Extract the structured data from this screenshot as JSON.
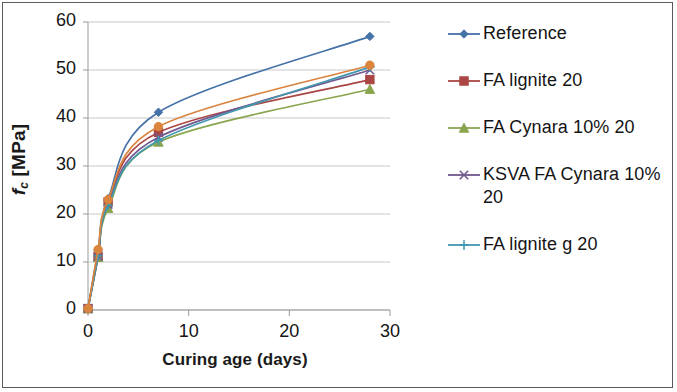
{
  "chart_data": {
    "type": "line",
    "title": "",
    "xlabel": "Curing age (days)",
    "ylabel": "fc [MPa]",
    "ylabel_parts": {
      "italic": "f",
      "subscript": "c",
      "rest": " [MPa]"
    },
    "x": [
      0,
      1,
      2,
      7,
      28
    ],
    "xlim": [
      0,
      30
    ],
    "ylim": [
      0,
      60
    ],
    "xticks": [
      0,
      10,
      20,
      30
    ],
    "yticks": [
      0,
      10,
      20,
      30,
      40,
      50,
      60
    ],
    "grid": "horizontal",
    "legend_position": "right",
    "series": [
      {
        "name": "Reference",
        "color": "#4572a7",
        "marker": "diamond",
        "values": [
          0.3,
          12.4,
          23.2,
          41.2,
          57.0
        ]
      },
      {
        "name": "FA lignite 20",
        "color": "#aa4643",
        "marker": "square",
        "values": [
          0.3,
          11.0,
          22.5,
          37.0,
          48.0
        ]
      },
      {
        "name": "FA  Cynara 10% 20",
        "color": "#89a54e",
        "marker": "triangle",
        "values": [
          0.3,
          11.0,
          21.2,
          35.0,
          46.0
        ]
      },
      {
        "name": "KSVA FA  Cynara 10% 20",
        "color": "#71588f",
        "marker": "x",
        "values": [
          0.3,
          11.2,
          22.0,
          36.0,
          50.0
        ]
      },
      {
        "name": "FA lignite g 20",
        "color": "#4198af",
        "marker": "cross",
        "values": [
          0.3,
          11.3,
          21.8,
          35.3,
          50.6
        ]
      },
      {
        "name": "",
        "color": "#db843d",
        "marker": "circle",
        "values": [
          0.3,
          12.6,
          23.0,
          38.2,
          51.0
        ]
      }
    ]
  },
  "axes": {
    "y_ticks": [
      "60",
      "50",
      "40",
      "30",
      "20",
      "10",
      "0"
    ],
    "x_ticks": [
      "0",
      "10",
      "20",
      "30"
    ],
    "x_title": "Curing age (days)"
  },
  "legend": {
    "items": [
      {
        "label": "Reference",
        "color": "#4572a7",
        "marker": "diamond"
      },
      {
        "label": "FA lignite 20",
        "color": "#aa4643",
        "marker": "square"
      },
      {
        "label": "FA  Cynara 10% 20",
        "color": "#89a54e",
        "marker": "triangle"
      },
      {
        "label": "KSVA FA  Cynara 10% 20",
        "color": "#71588f",
        "marker": "x"
      },
      {
        "label": "FA lignite g 20",
        "color": "#4198af",
        "marker": "cross"
      }
    ]
  }
}
